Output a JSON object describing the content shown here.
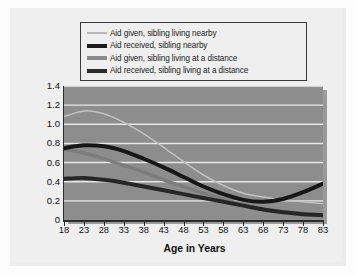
{
  "chart_data": {
    "type": "line",
    "title": "",
    "xlabel": "Age in Years",
    "ylabel": "Mean Degree of Aid Given or Received",
    "xlim": [
      18,
      83
    ],
    "ylim": [
      0,
      1.4
    ],
    "grid": true,
    "legend_position": "top",
    "xticks": [
      "18",
      "23",
      "28",
      "33",
      "38",
      "43",
      "48",
      "53",
      "58",
      "63",
      "68",
      "73",
      "78",
      "83"
    ],
    "xtick_values": [
      18,
      23,
      28,
      33,
      38,
      43,
      48,
      53,
      58,
      63,
      68,
      73,
      78,
      83
    ],
    "yticks": [
      "1.4",
      "1.2",
      "1.0",
      "0.8",
      "0.6",
      "0.4",
      "0.2",
      "0"
    ],
    "ytick_values": [
      1.4,
      1.2,
      1.0,
      0.8,
      0.6,
      0.4,
      0.2,
      0
    ],
    "x": [
      18,
      23,
      28,
      33,
      38,
      43,
      48,
      53,
      58,
      63,
      68,
      73,
      78,
      83
    ],
    "series": [
      {
        "name": "Aid given, sibling living nearby",
        "color": "#c2c2c2",
        "width": 1.5,
        "values": [
          1.08,
          1.14,
          1.11,
          1.02,
          0.9,
          0.76,
          0.61,
          0.47,
          0.36,
          0.28,
          0.24,
          0.21,
          0.19,
          0.17
        ]
      },
      {
        "name": "Aid received, sibling nearby",
        "color": "#171717",
        "width": 4.0,
        "values": [
          0.75,
          0.78,
          0.77,
          0.72,
          0.64,
          0.55,
          0.45,
          0.35,
          0.27,
          0.21,
          0.19,
          0.22,
          0.29,
          0.38
        ]
      },
      {
        "name": "Aid given, sibling living at a distance",
        "color": "#7d7d7d",
        "width": 3.4,
        "values": [
          0.74,
          0.7,
          0.64,
          0.57,
          0.5,
          0.42,
          0.35,
          0.28,
          0.22,
          0.16,
          0.12,
          0.09,
          0.07,
          0.05
        ]
      },
      {
        "name": "Aid received, sibling living at a distance",
        "color": "#262626",
        "width": 4.0,
        "values": [
          0.43,
          0.44,
          0.42,
          0.39,
          0.35,
          0.31,
          0.27,
          0.23,
          0.19,
          0.15,
          0.11,
          0.08,
          0.06,
          0.05
        ]
      }
    ]
  },
  "legend": {
    "items": [
      {
        "label": "Aid given, sibling living nearby"
      },
      {
        "label": "Aid received, sibling nearby"
      },
      {
        "label": "Aid given, sibling living at a distance"
      },
      {
        "label": "Aid received, sibling living at a distance"
      }
    ]
  },
  "axes": {
    "x_title": "Age in Years",
    "y_title": "Mean Degree of Aid Given or Received"
  },
  "colors": {
    "plot_background": "#8d8d8d",
    "card_background": "#efefef",
    "gridline": "#e8e8e8",
    "axis": "#2c2c2c",
    "text": "#111111"
  }
}
